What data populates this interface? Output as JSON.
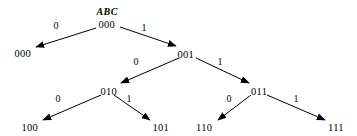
{
  "diagram": {
    "type": "binary-decision-tree",
    "caption_label": "ABC",
    "stroke_color": "#000000",
    "background_color": "#ffffff",
    "nodes": [
      {
        "id": "root",
        "label": "000",
        "x": 107,
        "y": 25,
        "level": 0
      },
      {
        "id": "n001",
        "label": "001",
        "x": 186,
        "y": 55,
        "level": 1
      },
      {
        "id": "n010",
        "label": "010",
        "x": 109,
        "y": 92,
        "level": 2
      },
      {
        "id": "n011",
        "label": "011",
        "x": 259,
        "y": 92,
        "level": 2
      }
    ],
    "leaves": [
      {
        "id": "l000",
        "label": "000",
        "x": 23,
        "y": 54
      },
      {
        "id": "l100",
        "label": "100",
        "x": 30,
        "y": 128
      },
      {
        "id": "l101",
        "label": "101",
        "x": 161,
        "y": 128
      },
      {
        "id": "l110",
        "label": "110",
        "x": 204,
        "y": 128
      },
      {
        "id": "l111",
        "label": "111",
        "x": 336,
        "y": 128
      }
    ],
    "edges": [
      {
        "id": "e-root-0",
        "from": "root",
        "to": "l000",
        "label": "0",
        "label_x": 56,
        "label_y": 26,
        "x1": 96,
        "y1": 28,
        "x2": 36,
        "y2": 47
      },
      {
        "id": "e-root-1",
        "from": "root",
        "to": "n001",
        "label": "1",
        "label_x": 144,
        "label_y": 28,
        "x1": 120,
        "y1": 27,
        "x2": 176,
        "y2": 46
      },
      {
        "id": "e-001-0",
        "from": "n001",
        "to": "n010",
        "label": "0",
        "label_x": 136,
        "label_y": 62,
        "x1": 179,
        "y1": 58,
        "x2": 121,
        "y2": 83
      },
      {
        "id": "e-001-1",
        "from": "n001",
        "to": "n011",
        "label": "1",
        "label_x": 220,
        "label_y": 62,
        "x1": 196,
        "y1": 58,
        "x2": 249,
        "y2": 83
      },
      {
        "id": "e-010-0",
        "from": "n010",
        "to": "l100",
        "label": "0",
        "label_x": 58,
        "label_y": 99,
        "x1": 101,
        "y1": 95,
        "x2": 43,
        "y2": 120
      },
      {
        "id": "e-010-1",
        "from": "n010",
        "to": "l101",
        "label": "1",
        "label_x": 129,
        "label_y": 99,
        "x1": 114,
        "y1": 95,
        "x2": 150,
        "y2": 120
      },
      {
        "id": "e-011-0",
        "from": "n011",
        "to": "l110",
        "label": "0",
        "label_x": 229,
        "label_y": 99,
        "x1": 251,
        "y1": 95,
        "x2": 218,
        "y2": 120
      },
      {
        "id": "e-011-1",
        "from": "n011",
        "to": "l111",
        "label": "1",
        "label_x": 296,
        "label_y": 99,
        "x1": 267,
        "y1": 95,
        "x2": 325,
        "y2": 120
      }
    ]
  }
}
